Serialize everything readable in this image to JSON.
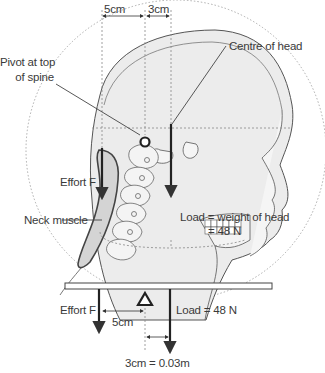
{
  "diagram": {
    "title": "",
    "type": "lever-diagram",
    "labels": {
      "dim_5cm_top": "5cm",
      "dim_3cm_top": "3cm",
      "pivot_line1": "Pivot at top",
      "pivot_line2": "of spine",
      "centre_of_head": "Centre of head",
      "effort_top": "Effort F",
      "neck_muscle": "Neck muscle",
      "load_line1": "Load = weight of head",
      "load_line2": "= 48 N",
      "effort_bottom": "Effort F",
      "dim_5cm_bottom": "5cm",
      "load_bottom": "Load = 48 N",
      "dim_3cm_bottom": "3cm = 0.03m"
    },
    "values": {
      "effort_distance_cm": 5,
      "load_distance_cm": 3,
      "load_distance_m": 0.03,
      "load_N": 48
    },
    "colors": {
      "line": "#333333",
      "head_fill": "#ececec",
      "muscle_fill": "#d4d4d4",
      "dotted": "#888888"
    }
  }
}
